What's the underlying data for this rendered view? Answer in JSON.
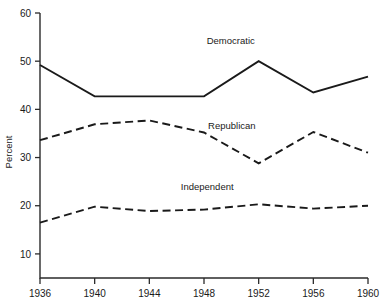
{
  "chart_data": {
    "type": "line",
    "title": "",
    "subtitle": "",
    "xlabel": "",
    "ylabel": "Percent",
    "x": [
      1936,
      1940,
      1944,
      1948,
      1952,
      1956,
      1960
    ],
    "xtick_labels": [
      "1936",
      "1940",
      "1944",
      "1948",
      "1952",
      "1956",
      "1960"
    ],
    "ytick_labels": [
      "10",
      "20",
      "30",
      "40",
      "50",
      "60"
    ],
    "yticks": [
      10,
      20,
      30,
      40,
      50,
      60
    ],
    "xlim": [
      1936,
      1960
    ],
    "ylim": [
      5,
      60
    ],
    "grid": false,
    "legend_position": "inline-annotations",
    "series": [
      {
        "name": "Democratic",
        "label": "Democratic",
        "style": "solid",
        "color": "#1a1a1a",
        "values": [
          49.2,
          42.7,
          42.7,
          42.7,
          50.0,
          43.5,
          46.8
        ],
        "label_x": 1948.2,
        "label_y": 53.5
      },
      {
        "name": "Republican",
        "label": "Republican",
        "style": "dashed",
        "color": "#1a1a1a",
        "values": [
          33.6,
          36.9,
          37.7,
          35.2,
          28.8,
          35.3,
          31.0
        ],
        "label_x": 1948.3,
        "label_y": 36.0
      },
      {
        "name": "Independent",
        "label": "Independent",
        "style": "dashed",
        "color": "#1a1a1a",
        "values": [
          16.5,
          19.8,
          18.9,
          19.2,
          20.3,
          19.4,
          20.0
        ],
        "label_x": 1946.3,
        "label_y": 23.2
      }
    ]
  }
}
